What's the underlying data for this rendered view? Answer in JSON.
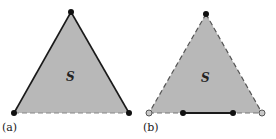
{
  "figure": {
    "panels": [
      {
        "label": "(a)",
        "region_label": "S",
        "vertices": {
          "apex": [
            71,
            12
          ],
          "left": [
            14,
            113
          ],
          "right": [
            129,
            113
          ]
        },
        "edges": {
          "left": "solid",
          "right": "solid",
          "bottom": "dashed"
        },
        "points": [
          {
            "name": "apex",
            "style": "filled-black"
          },
          {
            "name": "left",
            "style": "filled-black"
          },
          {
            "name": "right",
            "style": "filled-black"
          }
        ]
      },
      {
        "label": "(b)",
        "region_label": "S",
        "vertices": {
          "apex": [
            206,
            14
          ],
          "left": [
            149,
            113
          ],
          "right": [
            262,
            113
          ]
        },
        "edges": {
          "left": "dashed",
          "right": "dashed",
          "bottom": "dashed"
        },
        "solid_segment": [
          [
            183,
            113
          ],
          [
            233,
            113
          ]
        ],
        "points": [
          {
            "name": "apex",
            "style": "filled-black"
          },
          {
            "name": "left",
            "style": "open-gray"
          },
          {
            "name": "right",
            "style": "open-gray"
          },
          {
            "name": "segment-start",
            "style": "filled-black"
          },
          {
            "name": "segment-end",
            "style": "filled-black"
          }
        ]
      }
    ],
    "colors": {
      "fill": "#b8b8b8",
      "stroke": "#1a1a1a",
      "dash": "#777777",
      "open_point": "#c8c8c8"
    }
  }
}
